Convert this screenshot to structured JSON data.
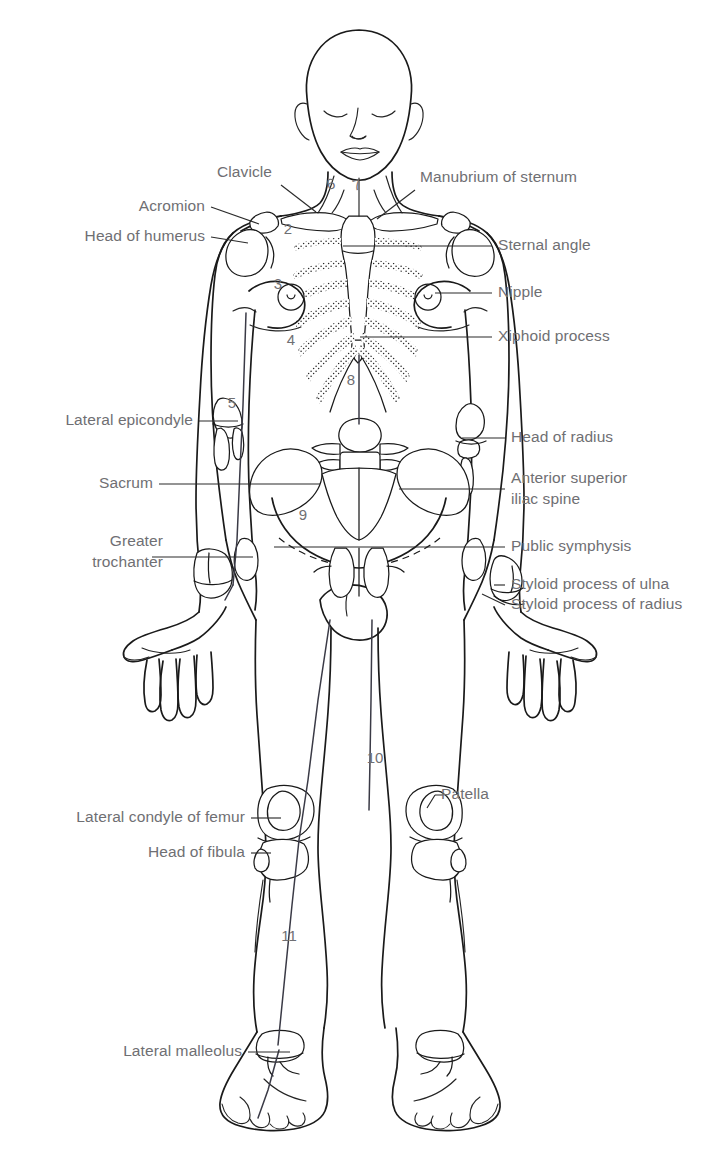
{
  "figure": {
    "type": "anatomical-surface-landmarks"
  },
  "labels_left": [
    {
      "id": "acromion",
      "text": "Acromion",
      "x": 205,
      "y": 211
    },
    {
      "id": "head-of-humerus",
      "text": "Head of humerus",
      "x": 205,
      "y": 241
    },
    {
      "id": "lateral-epicondyle",
      "text": "Lateral epicondyle",
      "x": 193,
      "y": 425
    },
    {
      "id": "sacrum",
      "text": "Sacrum",
      "x": 153,
      "y": 488
    },
    {
      "id": "greater-trochanter-1",
      "text": "Greater",
      "x": 163,
      "y": 546
    },
    {
      "id": "greater-trochanter-2",
      "text": "trochanter",
      "x": 163,
      "y": 567
    },
    {
      "id": "lateral-condyle-of-femur",
      "text": "Lateral condyle of femur",
      "x": 245,
      "y": 822
    },
    {
      "id": "head-of-fibula",
      "text": "Head of fibula",
      "x": 245,
      "y": 857
    },
    {
      "id": "lateral-malleolus",
      "text": "Lateral malleolus",
      "x": 242,
      "y": 1056
    }
  ],
  "labels_top_left": [
    {
      "id": "clavicle",
      "text": "Clavicle",
      "x": 275,
      "y": 177
    }
  ],
  "labels_right": [
    {
      "id": "manubrium-of-sternum",
      "text": "Manubrium of sternum",
      "x": 420,
      "y": 182
    },
    {
      "id": "sternal-angle",
      "text": "Sternal angle",
      "x": 498,
      "y": 250
    },
    {
      "id": "nipple",
      "text": "Nipple",
      "x": 498,
      "y": 297
    },
    {
      "id": "xiphoid-process",
      "text": "Xiphoid process",
      "x": 498,
      "y": 341
    },
    {
      "id": "head-of-radius",
      "text": "Head of radius",
      "x": 511,
      "y": 442
    },
    {
      "id": "anterior-superior-iliac-spine-1",
      "text": "Anterior superior",
      "x": 511,
      "y": 483
    },
    {
      "id": "anterior-superior-iliac-spine-2",
      "text": "iliac spine",
      "x": 511,
      "y": 504
    },
    {
      "id": "public-symphysis",
      "text": "Public symphysis",
      "x": 511,
      "y": 551
    },
    {
      "id": "styloid-process-of-ulna",
      "text": "Styloid process of ulna",
      "x": 511,
      "y": 589
    },
    {
      "id": "styloid-process-of-radius",
      "text": "Styloid process of radius",
      "x": 511,
      "y": 609
    },
    {
      "id": "patella",
      "text": "Patella",
      "x": 441,
      "y": 799
    }
  ],
  "numbered_markers": [
    {
      "id": "marker-2",
      "number": "2",
      "x": 288,
      "y": 234
    },
    {
      "id": "marker-3",
      "number": "3",
      "x": 278,
      "y": 289
    },
    {
      "id": "marker-4",
      "number": "4",
      "x": 291,
      "y": 345
    },
    {
      "id": "marker-5",
      "number": "5",
      "x": 232,
      "y": 408
    },
    {
      "id": "marker-6",
      "number": "6",
      "x": 332,
      "y": 189
    },
    {
      "id": "marker-7",
      "number": "7",
      "x": 358,
      "y": 190
    },
    {
      "id": "marker-8",
      "number": "8",
      "x": 351,
      "y": 385
    },
    {
      "id": "marker-9",
      "number": "9",
      "x": 303,
      "y": 520
    },
    {
      "id": "marker-10",
      "number": "10",
      "x": 375,
      "y": 763
    },
    {
      "id": "marker-11",
      "number": "11",
      "x": 289,
      "y": 941
    }
  ],
  "colors": {
    "background": "#ffffff",
    "outline": "#1a1a1a",
    "label_text": "#6f6f73",
    "leader_line": "#2b2b2b",
    "measure_line": "#3a3a46",
    "stipple": "#2a2a2a"
  }
}
